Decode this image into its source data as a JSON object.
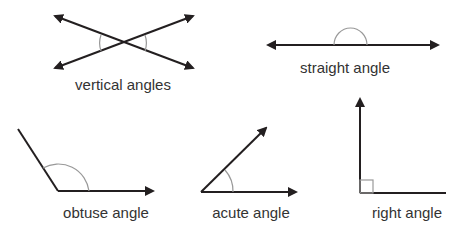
{
  "colors": {
    "line": "#231f20",
    "arc": "#999999",
    "text": "#333333",
    "background": "#ffffff"
  },
  "diagrams": [
    {
      "id": "vertical",
      "label": "vertical angles"
    },
    {
      "id": "straight",
      "label": "straight angle"
    },
    {
      "id": "obtuse",
      "label": "obtuse angle"
    },
    {
      "id": "acute",
      "label": "acute angle"
    },
    {
      "id": "right",
      "label": "right angle"
    }
  ]
}
